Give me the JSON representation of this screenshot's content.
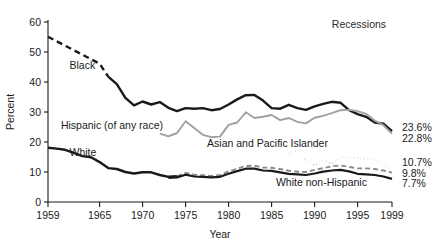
{
  "chart_data": {
    "type": "line",
    "title": "",
    "xlabel": "Year",
    "ylabel": "Percent",
    "xlim": [
      1959,
      1999
    ],
    "ylim": [
      0,
      60
    ],
    "grid": false,
    "legend_position": "inline-annotations",
    "xticks": [
      1959,
      1965,
      1970,
      1975,
      1980,
      1985,
      1990,
      1995,
      1999
    ],
    "xtick_labels": [
      "1959",
      "1965",
      "1970",
      "1975",
      "1980",
      "1985",
      "1990",
      "1995",
      "1999"
    ],
    "yticks": [
      0,
      10,
      20,
      30,
      40,
      50,
      60
    ],
    "ytick_labels": [
      "0",
      "10",
      "20",
      "30",
      "40",
      "50",
      "60"
    ],
    "annotations": [
      {
        "text": "Recessions",
        "x": 1992,
        "y": 58
      },
      {
        "text": "Black",
        "x": 1961.5,
        "y": 44.5
      },
      {
        "text": "Hispanic (of any race)",
        "x": 1960.5,
        "y": 24.5
      },
      {
        "text": "White",
        "x": 1961.5,
        "y": 15.5
      },
      {
        "text": "Asian and Pacific Islander",
        "x": 1977.5,
        "y": 18.5
      },
      {
        "text": "White non-Hispanic",
        "x": 1985.5,
        "y": 5.5
      }
    ],
    "end_labels": [
      {
        "text": "23.6%",
        "value": 23.6,
        "series": "Black"
      },
      {
        "text": "22.8%",
        "value": 22.8,
        "series": "Hispanic (of any race)"
      },
      {
        "text": "10.7%",
        "value": 10.7,
        "series": "Asian and Pacific Islander"
      },
      {
        "text": "9.8%",
        "value": 9.8,
        "series": "White"
      },
      {
        "text": "7.7%",
        "value": 7.7,
        "series": "White non-Hispanic"
      }
    ],
    "series": [
      {
        "name": "Black",
        "color": "#1a1a1a",
        "style": "solid-with-dashed-lead",
        "dashed_until": 1966,
        "x": [
          1959,
          1960,
          1961,
          1962,
          1963,
          1964,
          1965,
          1966,
          1967,
          1968,
          1969,
          1970,
          1971,
          1972,
          1973,
          1974,
          1975,
          1976,
          1977,
          1978,
          1979,
          1980,
          1981,
          1982,
          1983,
          1984,
          1985,
          1986,
          1987,
          1988,
          1989,
          1990,
          1991,
          1992,
          1993,
          1994,
          1995,
          1996,
          1997,
          1998,
          1999
        ],
        "values": [
          55.1,
          53.6,
          52.1,
          50.6,
          49.1,
          47.6,
          46.1,
          41.8,
          39.3,
          34.7,
          32.2,
          33.5,
          32.5,
          33.3,
          31.4,
          30.3,
          31.3,
          31.1,
          31.3,
          30.6,
          31.0,
          32.5,
          34.2,
          35.6,
          35.7,
          33.8,
          31.3,
          31.1,
          32.4,
          31.3,
          30.7,
          31.9,
          32.7,
          33.4,
          33.1,
          30.6,
          29.3,
          28.4,
          26.5,
          26.1,
          23.6
        ]
      },
      {
        "name": "Hispanic (of any race)",
        "color": "#a0a0a0",
        "style": "solid",
        "x": [
          1972,
          1973,
          1974,
          1975,
          1976,
          1977,
          1978,
          1979,
          1980,
          1981,
          1982,
          1983,
          1984,
          1985,
          1986,
          1987,
          1988,
          1989,
          1990,
          1991,
          1992,
          1993,
          1994,
          1995,
          1996,
          1997,
          1998,
          1999
        ],
        "values": [
          22.8,
          21.9,
          23.0,
          26.9,
          24.7,
          22.4,
          21.6,
          21.8,
          25.7,
          26.5,
          29.9,
          28.0,
          28.4,
          29.0,
          27.3,
          28.0,
          26.7,
          26.2,
          28.1,
          28.7,
          29.6,
          30.6,
          30.7,
          30.3,
          29.4,
          27.1,
          25.6,
          22.8
        ]
      },
      {
        "name": "Asian and Pacific Islander",
        "color": "#1a1a1a",
        "style": "dotted",
        "x": [
          1987,
          1988,
          1989,
          1990,
          1991,
          1992,
          1993,
          1994,
          1995,
          1996,
          1997,
          1998,
          1999
        ],
        "values": [
          16.1,
          17.3,
          14.1,
          12.2,
          13.8,
          12.7,
          15.3,
          14.6,
          14.6,
          14.5,
          14.0,
          12.5,
          10.7
        ]
      },
      {
        "name": "White",
        "color": "#8a8a8a",
        "style": "solid-then-dashed",
        "dashed_from": 1974,
        "x": [
          1959,
          1960,
          1961,
          1962,
          1963,
          1964,
          1965,
          1966,
          1967,
          1968,
          1969,
          1970,
          1971,
          1972,
          1973,
          1974,
          1975,
          1976,
          1977,
          1978,
          1979,
          1980,
          1981,
          1982,
          1983,
          1984,
          1985,
          1986,
          1987,
          1988,
          1989,
          1990,
          1991,
          1992,
          1993,
          1994,
          1995,
          1996,
          1997,
          1998,
          1999
        ],
        "values": [
          18.1,
          17.8,
          17.4,
          16.4,
          15.3,
          14.9,
          13.3,
          11.3,
          11.0,
          10.0,
          9.5,
          9.9,
          9.9,
          9.0,
          8.4,
          8.6,
          9.7,
          9.1,
          8.9,
          8.7,
          9.0,
          10.2,
          11.1,
          12.0,
          12.1,
          11.5,
          11.4,
          11.0,
          10.4,
          10.1,
          10.0,
          10.7,
          11.3,
          11.9,
          12.2,
          11.7,
          11.2,
          11.2,
          11.0,
          10.5,
          9.8
        ]
      },
      {
        "name": "White non-Hispanic",
        "color": "#1a1a1a",
        "style": "solid",
        "x": [
          1973,
          1974,
          1975,
          1976,
          1977,
          1978,
          1979,
          1980,
          1981,
          1982,
          1983,
          1984,
          1985,
          1986,
          1987,
          1988,
          1989,
          1990,
          1991,
          1992,
          1993,
          1994,
          1995,
          1996,
          1997,
          1998,
          1999
        ],
        "values": [
          8.0,
          8.2,
          9.1,
          8.5,
          8.4,
          8.2,
          8.4,
          9.4,
          10.3,
          11.1,
          11.1,
          10.5,
          10.4,
          9.9,
          9.4,
          9.2,
          9.0,
          9.5,
          10.1,
          10.5,
          10.7,
          10.2,
          9.4,
          9.2,
          9.0,
          8.5,
          7.7
        ]
      }
    ]
  },
  "ylabel": "Percent",
  "xlabel": "Year",
  "recessions_label": "Recessions"
}
